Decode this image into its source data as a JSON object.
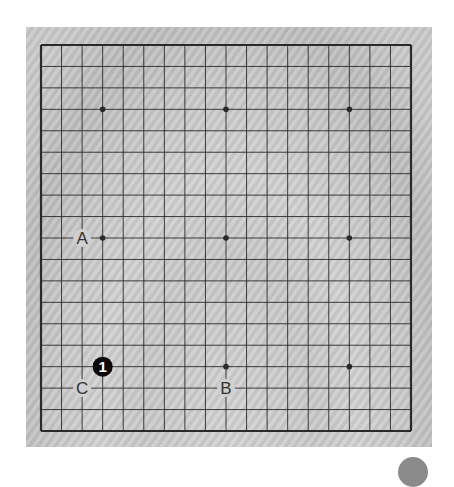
{
  "board": {
    "size": 19,
    "origin": {
      "x": 41,
      "y": 45
    },
    "extent": {
      "x": 411,
      "y": 431
    },
    "colors": {
      "wood": "#c9c9c9",
      "line": "#2a2a2a",
      "stone_black": "#0a0a0a",
      "label_bg": "#cfcfcf",
      "label_text": "#333333"
    },
    "star_points": [
      [
        3,
        3
      ],
      [
        9,
        3
      ],
      [
        15,
        3
      ],
      [
        3,
        9
      ],
      [
        9,
        9
      ],
      [
        15,
        9
      ],
      [
        3,
        15
      ],
      [
        9,
        15
      ],
      [
        15,
        15
      ]
    ],
    "stones": [
      {
        "col": 3,
        "row": 15,
        "color": "black",
        "number": "1"
      }
    ],
    "labels": [
      {
        "col": 2,
        "row": 9,
        "text": "A"
      },
      {
        "col": 9,
        "row": 16,
        "text": "B"
      },
      {
        "col": 2,
        "row": 16,
        "text": "C"
      }
    ]
  }
}
